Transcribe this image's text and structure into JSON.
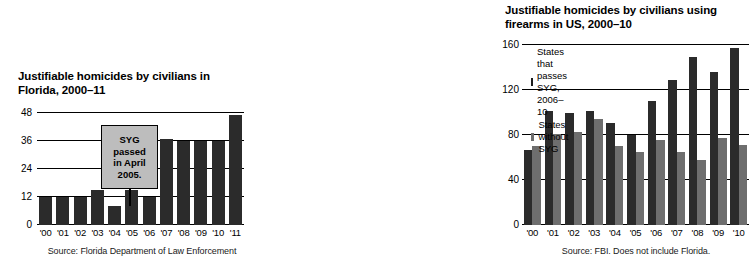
{
  "chart_data": [
    {
      "id": "florida",
      "type": "bar",
      "title": "Justifiable homicides by civilians in Florida, 2000–11",
      "title_line1": "Justifiable homicides by civilians in",
      "title_line2": "Florida, 2000–11",
      "xlabel": "",
      "ylabel": "",
      "ylim": [
        0,
        48
      ],
      "yticks": [
        0,
        12,
        24,
        36,
        48
      ],
      "grid": true,
      "legend": "none",
      "categories": [
        "'00",
        "'01",
        "'02",
        "'03",
        "'04",
        "'05",
        "'06",
        "'07",
        "'08",
        "'09",
        "'10",
        "'11"
      ],
      "values": [
        12,
        12,
        12,
        15,
        8,
        15,
        12,
        37,
        36,
        36,
        36,
        47
      ],
      "bar_color": "#2b2b2b",
      "annotation": {
        "lines": [
          "SYG",
          "passed",
          "in April",
          "2005."
        ],
        "text": "SYG passed in April 2005.",
        "points_to_category": "'05",
        "fill": "#bdbdbd",
        "border": "#000000"
      },
      "source": "Source: Florida Department of Law Enforcement"
    },
    {
      "id": "us-firearms",
      "type": "bar",
      "title": "Justifiable homicides by civilians using firearms in US, 2000–10",
      "title_line1": "Justifiable homicides by civilians using",
      "title_line2": "firearms in US, 2000–10",
      "xlabel": "",
      "ylabel": "",
      "ylim": [
        0,
        160
      ],
      "yticks": [
        0,
        40,
        80,
        120,
        160
      ],
      "grid": true,
      "legend": "top-left",
      "categories": [
        "'00",
        "'01",
        "'02",
        "'03",
        "'04",
        "'05",
        "'06",
        "'07",
        "'08",
        "'09",
        "'10"
      ],
      "series": [
        {
          "name": "States that passes SYG, 2006–10",
          "color": "#2b2b2b",
          "values": [
            67,
            101,
            100,
            101,
            91,
            80,
            110,
            129,
            149,
            136,
            157
          ]
        },
        {
          "name": "States without SYG",
          "color": "#6e6e6e",
          "values": [
            70,
            81,
            83,
            94,
            70,
            65,
            76,
            65,
            58,
            77,
            71
          ]
        }
      ],
      "source": "Source: FBI. Does not include Florida."
    }
  ],
  "colors": {
    "background": "#ffffff",
    "dark_series": "#2b2b2b",
    "gray_series": "#6e6e6e",
    "callout_fill": "#bdbdbd",
    "axis": "#000000"
  }
}
